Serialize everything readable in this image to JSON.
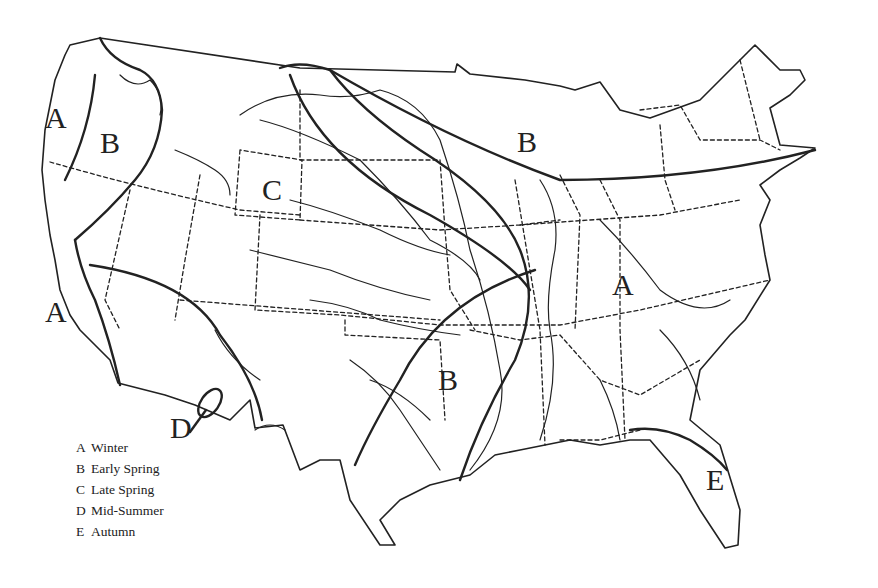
{
  "map": {
    "title": "",
    "subject": "United States seasonal regions",
    "labels": [
      {
        "id": "A-northwest",
        "text": "A",
        "x": 45,
        "y": 103
      },
      {
        "id": "B-northwest",
        "text": "B",
        "x": 100,
        "y": 128
      },
      {
        "id": "C-rockies",
        "text": "C",
        "x": 262,
        "y": 175
      },
      {
        "id": "B-great-lakes",
        "text": "B",
        "x": 517,
        "y": 127
      },
      {
        "id": "A-california",
        "text": "A",
        "x": 45,
        "y": 297
      },
      {
        "id": "A-east",
        "text": "A",
        "x": 612,
        "y": 270
      },
      {
        "id": "B-south",
        "text": "B",
        "x": 438,
        "y": 365
      },
      {
        "id": "D-arizona",
        "text": "D",
        "x": 170,
        "y": 413
      },
      {
        "id": "E-florida",
        "text": "E",
        "x": 706,
        "y": 465
      }
    ]
  },
  "legend": {
    "items": [
      {
        "key": "A",
        "label": "Winter"
      },
      {
        "key": "B",
        "label": "Early Spring"
      },
      {
        "key": "C",
        "label": "Late Spring"
      },
      {
        "key": "D",
        "label": "Mid-Summer"
      },
      {
        "key": "E",
        "label": "Autumn"
      }
    ]
  },
  "colors": {
    "ink": "#222222",
    "paper": "#ffffff"
  }
}
